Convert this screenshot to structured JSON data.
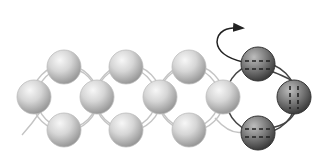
{
  "diagram": {
    "colors": {
      "background": "#ffffff",
      "light_bead_highlight": "#f4f4f4",
      "light_bead_shadow": "#9a9a9a",
      "light_thread": "#c4c4c4",
      "dark_bead_highlight": "#c8c8c8",
      "dark_bead_shadow": "#3a3a3a",
      "dark_thread": "#444444",
      "arrow": "#222222"
    },
    "bead_radius": 17,
    "units": [
      {
        "name": "unit-1",
        "style": "light",
        "beads": [
          {
            "pos": "top",
            "x": 64,
            "y": 67
          },
          {
            "pos": "left",
            "x": 34,
            "y": 97
          },
          {
            "pos": "right",
            "x": 97,
            "y": 97
          },
          {
            "pos": "bottom",
            "x": 64,
            "y": 130
          }
        ]
      },
      {
        "name": "unit-2",
        "style": "light",
        "beads": [
          {
            "pos": "top",
            "x": 126,
            "y": 67
          },
          {
            "pos": "right",
            "x": 160,
            "y": 97
          },
          {
            "pos": "bottom",
            "x": 126,
            "y": 130
          }
        ]
      },
      {
        "name": "unit-3",
        "style": "light",
        "beads": [
          {
            "pos": "top",
            "x": 189,
            "y": 67
          },
          {
            "pos": "right",
            "x": 223,
            "y": 97
          },
          {
            "pos": "bottom",
            "x": 189,
            "y": 130
          }
        ]
      },
      {
        "name": "unit-4",
        "style": "dark",
        "beads": [
          {
            "pos": "top",
            "x": 258,
            "y": 64
          },
          {
            "pos": "right",
            "x": 294,
            "y": 97
          },
          {
            "pos": "bottom",
            "x": 258,
            "y": 133
          }
        ]
      }
    ],
    "arrow": {
      "direction": "up-and-right",
      "label": ""
    }
  }
}
